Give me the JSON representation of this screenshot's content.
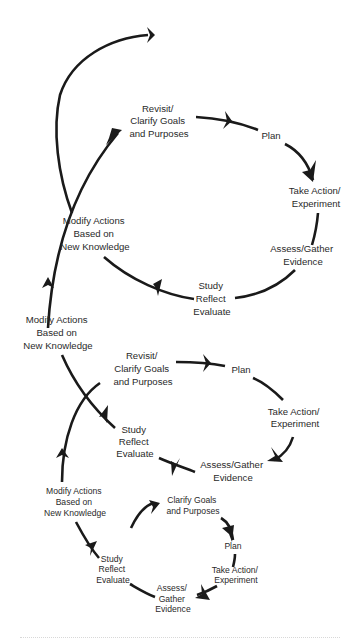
{
  "diagram": {
    "type": "spiral-cycle",
    "colors": {
      "stroke": "#1a1a1a",
      "text": "#2a2a2a",
      "background": "#ffffff"
    },
    "top_cycle": {
      "revisit": [
        "Revisit/",
        "Clarify Goals",
        "and Purposes"
      ],
      "plan": [
        "Plan"
      ],
      "take_action": [
        "Take Action/",
        "Experiment"
      ],
      "assess": [
        "Assess/Gather",
        "Evidence"
      ],
      "study": [
        "Study",
        "Reflect",
        "Evaluate"
      ],
      "modify": [
        "Modify Actions",
        "Based on",
        "New Knowledge"
      ]
    },
    "middle_cycle": {
      "modify_in": [
        "Modify Actions",
        "Based on",
        "New Knowledge"
      ],
      "revisit": [
        "Revisit/",
        "Clarify Goals",
        "and Purposes"
      ],
      "plan": [
        "Plan"
      ],
      "take_action": [
        "Take Action/",
        "Experiment"
      ],
      "assess": [
        "Assess/Gather",
        "Evidence"
      ],
      "study": [
        "Study",
        "Reflect",
        "Evaluate"
      ]
    },
    "bottom_cycle": {
      "modify_in": [
        "Modify Actions",
        "Based on",
        "New Knowledge"
      ],
      "clarify": [
        "Clarify Goals",
        "and Purposes"
      ],
      "plan": [
        "Plan"
      ],
      "take_action": [
        "Take Action/",
        "Experiment"
      ],
      "assess": [
        "Assess/",
        "Gather",
        "Evidence"
      ],
      "study": [
        "Study",
        "Reflect",
        "Evaluate"
      ]
    }
  }
}
